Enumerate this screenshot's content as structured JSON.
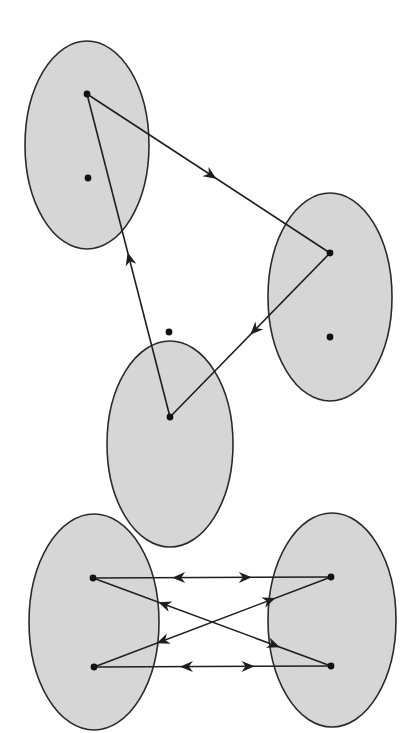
{
  "colors": {
    "set_fill": "#d6d6d6",
    "set_stroke": "#2a2a2a",
    "edge": "#1e1e1e",
    "point": "#111111",
    "background": "#ffffff"
  },
  "top_diagram": {
    "sets": [
      {
        "id": "A",
        "cx": 87,
        "cy": 145,
        "rx": 62,
        "ry": 104,
        "points": [
          {
            "x": 87,
            "y": 94
          },
          {
            "x": 88,
            "y": 178
          }
        ]
      },
      {
        "id": "B",
        "cx": 330,
        "cy": 297,
        "rx": 62,
        "ry": 104,
        "points": [
          {
            "x": 330,
            "y": 253
          },
          {
            "x": 330,
            "y": 337
          }
        ]
      },
      {
        "id": "C",
        "cx": 170,
        "cy": 444,
        "rx": 63,
        "ry": 103,
        "points": [
          {
            "x": 169,
            "y": 332
          },
          {
            "x": 170,
            "y": 417
          }
        ]
      }
    ],
    "edges": [
      {
        "from": [
          87,
          94
        ],
        "to": [
          330,
          253
        ],
        "arrow_at": 0.51,
        "direction": "forward"
      },
      {
        "from": [
          330,
          253
        ],
        "to": [
          170,
          417
        ],
        "arrow_at": 0.47,
        "direction": "forward"
      },
      {
        "from": [
          170,
          417
        ],
        "to": [
          87,
          94
        ],
        "arrow_at": 0.49,
        "direction": "forward"
      }
    ]
  },
  "bottom_diagram": {
    "sets": [
      {
        "id": "L",
        "cx": 94,
        "cy": 622,
        "rx": 65,
        "ry": 108,
        "points": [
          {
            "x": 93,
            "y": 578
          },
          {
            "x": 94,
            "y": 667
          }
        ]
      },
      {
        "id": "R",
        "cx": 332,
        "cy": 620,
        "rx": 64,
        "ry": 107,
        "points": [
          {
            "x": 331,
            "y": 577
          },
          {
            "x": 331,
            "y": 666
          }
        ]
      }
    ],
    "edges": [
      {
        "from": [
          93,
          578
        ],
        "to": [
          331,
          577
        ],
        "arrows": [
          {
            "at": 0.36,
            "dir": "backward"
          },
          {
            "at": 0.64,
            "dir": "forward"
          }
        ]
      },
      {
        "from": [
          94,
          667
        ],
        "to": [
          331,
          666
        ],
        "arrows": [
          {
            "at": 0.39,
            "dir": "backward"
          },
          {
            "at": 0.65,
            "dir": "forward"
          }
        ]
      },
      {
        "from": [
          93,
          578
        ],
        "to": [
          331,
          666
        ],
        "arrows": [
          {
            "at": 0.3,
            "dir": "backward"
          },
          {
            "at": 0.76,
            "dir": "forward"
          }
        ]
      },
      {
        "from": [
          94,
          667
        ],
        "to": [
          331,
          577
        ],
        "arrows": [
          {
            "at": 0.29,
            "dir": "backward"
          },
          {
            "at": 0.74,
            "dir": "forward"
          }
        ]
      }
    ]
  }
}
